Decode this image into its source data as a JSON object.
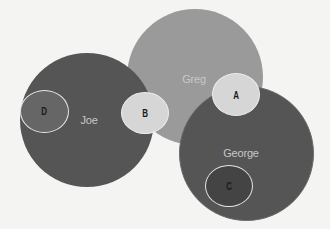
{
  "diagram": {
    "type": "overlapping-circles",
    "colors": {
      "background": "#f4f4f2",
      "dark_circle": "#555555",
      "mid_circle": "#9a9a9a",
      "light_circle": "#d6d6d6",
      "outline": "#e6e6e6"
    },
    "circles": [
      {
        "id": "greg",
        "label": "Greg"
      },
      {
        "id": "joe",
        "label": "Joe"
      },
      {
        "id": "george",
        "label": "George"
      }
    ],
    "small_circles": [
      {
        "id": "a",
        "label": "A"
      },
      {
        "id": "b",
        "label": "B"
      },
      {
        "id": "c",
        "label": "C"
      },
      {
        "id": "d",
        "label": "D"
      }
    ]
  }
}
